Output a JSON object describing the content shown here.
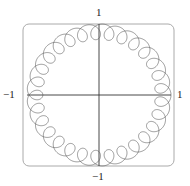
{
  "chart_data": {
    "type": "line",
    "subtype": "parametric-curve",
    "title": "",
    "xlabel": "",
    "ylabel": "",
    "xlim": [
      -1,
      1
    ],
    "ylim": [
      -1,
      1
    ],
    "grid": false,
    "legend": null,
    "axis_labels": {
      "top": "1",
      "bottom": "−1",
      "left": "−1",
      "right": "1"
    },
    "curve": {
      "description": "woven ring of overlapping loops forming an annulus between r≈0.78 and r=1",
      "base_radius": 0.89,
      "loop_radius": 0.11,
      "loop_frequency": 30,
      "samples": 3000,
      "stroke": "#555555"
    }
  },
  "layout": {
    "frame": {
      "x": 23,
      "y": 24,
      "w": 151,
      "h": 142,
      "rx": 6,
      "stroke": "#aaaaaa"
    },
    "origin": {
      "x": 99,
      "y": 95
    },
    "scale": {
      "x": 72,
      "y": 71
    },
    "axis_color": "#333333"
  }
}
